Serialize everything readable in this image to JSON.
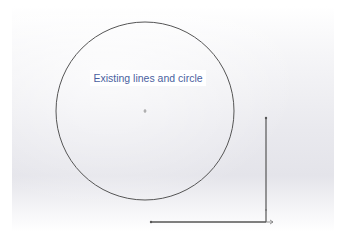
{
  "canvas": {
    "annotation": "Existing lines and circle",
    "annotation_color": "#4a5fa0",
    "line_color": "#555555"
  },
  "sketch": {
    "circle": {
      "cx": 145,
      "cy": 111,
      "r": 89
    },
    "vertical_line": {
      "x": 266,
      "y1": 118,
      "y2": 222
    },
    "horizontal_line": {
      "x1": 151,
      "x2": 266,
      "y": 222
    }
  }
}
